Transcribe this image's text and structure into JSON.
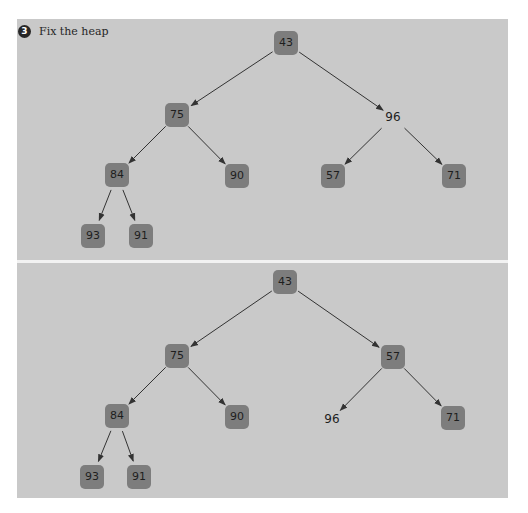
{
  "exercise": {
    "number": "3",
    "title": "Fix the heap"
  },
  "colors": {
    "panel_bg": "#c9c9c9",
    "node_fill": "#7d7d7d",
    "node_text": "#1e1e1e",
    "edge": "#333333",
    "badge": "#262626"
  },
  "diagrams": [
    {
      "name": "before",
      "nodes": [
        {
          "id": "n43",
          "label": "43",
          "x": 286,
          "y": 43,
          "boxed": true
        },
        {
          "id": "n75",
          "label": "75",
          "x": 177,
          "y": 115,
          "boxed": true
        },
        {
          "id": "n96",
          "label": "96",
          "x": 393,
          "y": 117,
          "boxed": false
        },
        {
          "id": "n84",
          "label": "84",
          "x": 117,
          "y": 175,
          "boxed": true
        },
        {
          "id": "n90",
          "label": "90",
          "x": 237,
          "y": 176,
          "boxed": true
        },
        {
          "id": "n57",
          "label": "57",
          "x": 333,
          "y": 176,
          "boxed": true
        },
        {
          "id": "n71",
          "label": "71",
          "x": 454,
          "y": 176,
          "boxed": true
        },
        {
          "id": "n93",
          "label": "93",
          "x": 93,
          "y": 236,
          "boxed": true
        },
        {
          "id": "n91",
          "label": "91",
          "x": 141,
          "y": 236,
          "boxed": true
        }
      ],
      "edges": [
        {
          "from": "43",
          "to": "75"
        },
        {
          "from": "43",
          "to": "96"
        },
        {
          "from": "75",
          "to": "84"
        },
        {
          "from": "75",
          "to": "90"
        },
        {
          "from": "96",
          "to": "57"
        },
        {
          "from": "96",
          "to": "71"
        },
        {
          "from": "84",
          "to": "93"
        },
        {
          "from": "84",
          "to": "91"
        }
      ]
    },
    {
      "name": "after",
      "nodes": [
        {
          "id": "m43",
          "label": "43",
          "x": 285,
          "y": 282,
          "boxed": true
        },
        {
          "id": "m75",
          "label": "75",
          "x": 177,
          "y": 356,
          "boxed": true
        },
        {
          "id": "m57",
          "label": "57",
          "x": 393,
          "y": 357,
          "boxed": true
        },
        {
          "id": "m84",
          "label": "84",
          "x": 117,
          "y": 416,
          "boxed": true
        },
        {
          "id": "m90",
          "label": "90",
          "x": 237,
          "y": 417,
          "boxed": true
        },
        {
          "id": "m96",
          "label": "96",
          "x": 332,
          "y": 419,
          "boxed": false
        },
        {
          "id": "m71",
          "label": "71",
          "x": 453,
          "y": 418,
          "boxed": true
        },
        {
          "id": "m93",
          "label": "93",
          "x": 92,
          "y": 477,
          "boxed": true
        },
        {
          "id": "m91",
          "label": "91",
          "x": 139,
          "y": 477,
          "boxed": true
        }
      ],
      "edges": [
        {
          "from": "43",
          "to": "75"
        },
        {
          "from": "43",
          "to": "57"
        },
        {
          "from": "75",
          "to": "84"
        },
        {
          "from": "75",
          "to": "90"
        },
        {
          "from": "57",
          "to": "96"
        },
        {
          "from": "57",
          "to": "71"
        },
        {
          "from": "84",
          "to": "93"
        },
        {
          "from": "84",
          "to": "91"
        }
      ]
    }
  ]
}
